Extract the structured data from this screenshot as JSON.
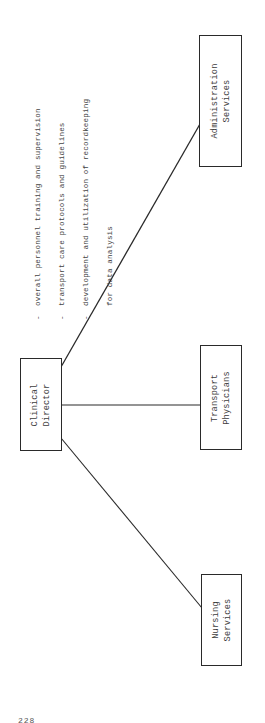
{
  "diagram": {
    "orientation": "rotated 90 degrees counter-clockwise",
    "root": {
      "id": "clinical-director",
      "label_lines": [
        "Clinical",
        "Director"
      ]
    },
    "children": [
      {
        "id": "nursing-services",
        "label_lines": [
          "Nursing",
          "Services"
        ]
      },
      {
        "id": "transport-physicians",
        "label_lines": [
          "Transport",
          "Physicians"
        ]
      },
      {
        "id": "administration-services",
        "label_lines": [
          "Administration",
          "Services"
        ]
      }
    ],
    "edges": [
      {
        "from": "clinical-director",
        "to": "nursing-services"
      },
      {
        "from": "clinical-director",
        "to": "transport-physicians"
      },
      {
        "from": "clinical-director",
        "to": "administration-services"
      }
    ],
    "responsibilities": {
      "attached_to": "clinical-director",
      "items": [
        {
          "dash": "-",
          "text": "overall personnel training and supervision"
        },
        {
          "dash": "-",
          "text": "transport care protocols and guidelines"
        },
        {
          "dash": "-",
          "text": "development and utilization of recordkeeping"
        },
        {
          "dash": "",
          "text": "for data analysis"
        }
      ]
    }
  },
  "page": {
    "number": "228"
  },
  "colors": {
    "line": "#2a2a2a",
    "text": "#3d3d3d",
    "background": "#ffffff"
  }
}
